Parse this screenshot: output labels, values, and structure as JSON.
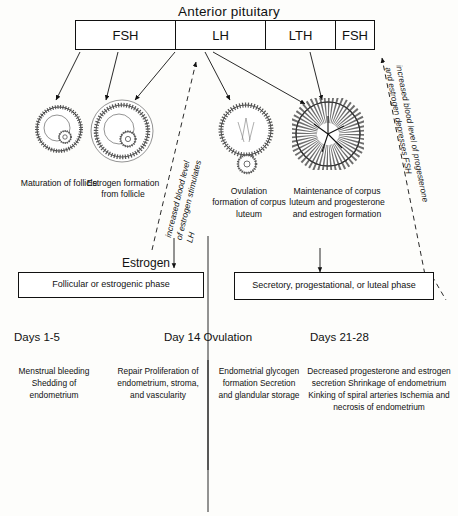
{
  "title": "Anterior pituitary",
  "hormones": [
    {
      "label": "FSH"
    },
    {
      "label": "LH"
    },
    {
      "label": "LTH"
    },
    {
      "label": "FSH"
    }
  ],
  "stages": [
    {
      "caption": "Maturation\nof follicle",
      "icon": "follicle-maturation-icon"
    },
    {
      "caption": "Estrogen\nformation\nfrom follicle",
      "icon": "follicle-estrogen-icon"
    },
    {
      "caption": "Ovulation\nformation\nof corpus\nluteum",
      "icon": "ovulation-corpus-luteum-icon"
    },
    {
      "caption": "Maintenance of\ncorpus luteum\nand progesterone\nand estrogen\nformation",
      "icon": "corpus-luteum-maintenance-icon"
    }
  ],
  "feedback": {
    "left": "increased blood level\nof estrogen stimulates\nLH",
    "right": "increased blood level of progesterone\nand estrogen depresses FSH"
  },
  "estrogen_label": "Estrogen",
  "phases": [
    {
      "label": "Follicular or estrogenic phase"
    },
    {
      "label": "Secretory, progestational,\nor luteal phase"
    }
  ],
  "days": [
    {
      "label": "Days 1-5"
    },
    {
      "label": "Day 14\nOvulation"
    },
    {
      "label": "Days 21-28"
    }
  ],
  "endometrium": [
    {
      "text": "Menstrual\nbleeding\nShedding of\nendometrium"
    },
    {
      "text": "Repair\nProliferation of\nendometrium,\nstroma, and\nvascularity"
    },
    {
      "text": "Endometrial\nglycogen\nformation\nSecretion and\nglandular\nstorage"
    },
    {
      "text": "Decreased progesterone\nand estrogen secretion\nShrinkage of endometrium\nKinking of spiral arteries\nIschemia and necrosis of\nendometrium"
    }
  ],
  "colors": {
    "ink": "#111111",
    "paper": "#fdfdfb"
  }
}
